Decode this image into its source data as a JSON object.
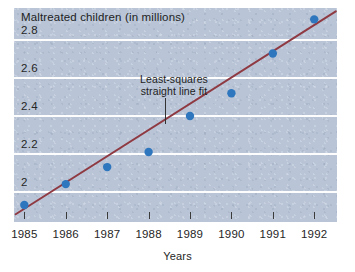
{
  "chart_data": {
    "type": "scatter",
    "title": "Maltreated children (in millions)",
    "xlabel": "Years",
    "ylabel": "",
    "categories": [
      "1985",
      "1986",
      "1987",
      "1988",
      "1989",
      "1990",
      "1991",
      "1992"
    ],
    "x": [
      1985,
      1986,
      1987,
      1988,
      1989,
      1990,
      1991,
      1992
    ],
    "values": [
      1.93,
      2.04,
      2.13,
      2.21,
      2.4,
      2.52,
      2.73,
      2.91
    ],
    "series": [
      {
        "name": "Maltreated children",
        "values": [
          1.93,
          2.04,
          2.13,
          2.21,
          2.4,
          2.52,
          2.73,
          2.91
        ]
      },
      {
        "name": "Least-squares straight line fit",
        "type": "line",
        "values": [
          1.91,
          2.05,
          2.19,
          2.33,
          2.46,
          2.6,
          2.74,
          2.88
        ]
      }
    ],
    "ylim": [
      1.84,
      2.97
    ],
    "xlim": [
      1984.75,
      1992.55
    ],
    "yticks": [
      2,
      2.2,
      2.4,
      2.6,
      2.8
    ],
    "ytick_labels": [
      "2",
      "2.2",
      "2.4",
      "2.6",
      "2.8"
    ],
    "xticks": [
      1985,
      1986,
      1987,
      1988,
      1989,
      1990,
      1991,
      1992
    ],
    "xtick_labels": [
      "1985",
      "1986",
      "1987",
      "1988",
      "1989",
      "1990",
      "1991",
      "1992"
    ],
    "grid": "horizontal",
    "legend": "none",
    "annotations": [
      {
        "text_line1": "Least-squares",
        "text_line2": "straight line fit",
        "target_x": 1988.4,
        "target_y": 2.36
      }
    ],
    "colors": {
      "panel_background": "#b9c5d7",
      "gridline": "#fdfdfd",
      "marker": "#2e76bd",
      "fit_line": "#8f3a42",
      "text": "#1d1d1d",
      "page_background": "#ffffff"
    }
  }
}
